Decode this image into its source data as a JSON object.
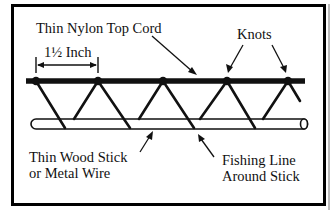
{
  "diagram": {
    "type": "truss-line-construction",
    "frame": {
      "border_color": "#000000",
      "background": "#ffffff"
    },
    "components": {
      "top_cord": {
        "label": "Thin Nylon Top Cord",
        "color": "#111111"
      },
      "knots": {
        "label": "Knots",
        "count": 5
      },
      "spacing": {
        "label": "1½ Inch"
      },
      "stick": {
        "label_line1": "Thin Wood Stick",
        "label_line2": "or Metal Wire"
      },
      "fishing_line": {
        "label_line1": "Fishing Line",
        "label_line2": "Around Stick"
      }
    }
  }
}
